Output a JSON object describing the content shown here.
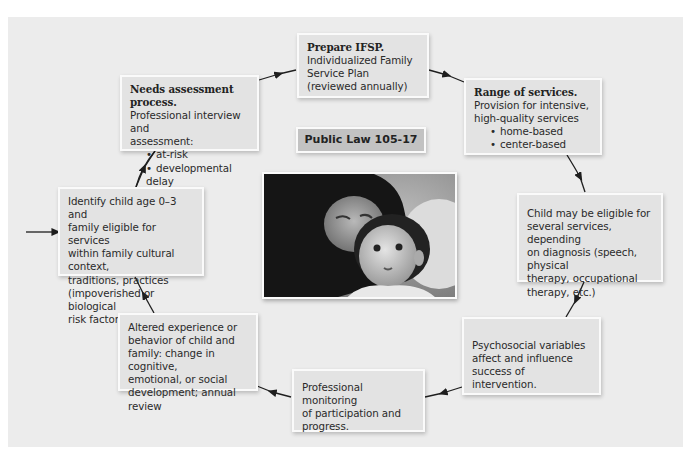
{
  "diagram": {
    "center_label": "Public Law 105-17",
    "photo": {
      "alt": "mother-and-infant-photo"
    },
    "nodes": {
      "prepare_ifsp": {
        "title": "Prepare IFSP.",
        "lines": [
          "Individualized Family",
          "Service Plan",
          "(reviewed annually)"
        ]
      },
      "range_services": {
        "title": "Range of services.",
        "lines": [
          "Provision for intensive,",
          "high-quality services"
        ],
        "bullets": [
          "home-based",
          "center-based"
        ]
      },
      "child_eligible": {
        "lines": [
          "Child may be eligible for",
          "several services, depending",
          "on diagnosis (speech, physical",
          "therapy, occupational",
          "therapy, etc.)"
        ]
      },
      "psychosocial": {
        "lines": [
          "Psychosocial variables",
          "affect and influence",
          "success of intervention."
        ]
      },
      "monitoring": {
        "lines": [
          "Professional monitoring",
          "of participation and",
          "progress."
        ]
      },
      "altered": {
        "lines": [
          "Altered experience or",
          "behavior of child and",
          "family: change in cognitive,",
          "emotional, or social",
          "development; annual review"
        ]
      },
      "identify": {
        "lines": [
          "Identify child age 0–3 and",
          "family eligible for services",
          "within family cultural context,",
          "traditions, practices",
          "(impoverished or biological",
          "risk factors)"
        ]
      },
      "needs": {
        "title": "Needs assessment process.",
        "lines": [
          "Professional interview and",
          "assessment:"
        ],
        "bullets": [
          "at-risk",
          "developmental delay"
        ]
      }
    },
    "colors": {
      "panel": "#ececec",
      "box": "#e3e3e3",
      "label": "#c2c2c2",
      "arrow": "#1e1e1e"
    }
  }
}
